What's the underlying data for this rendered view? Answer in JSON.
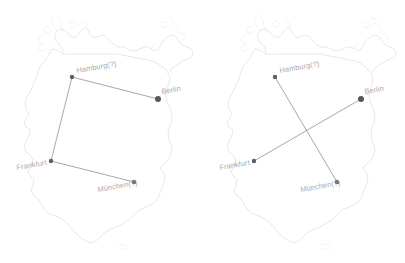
{
  "figure": {
    "background_color": "#ffffff",
    "outline_color": "#d8d8da",
    "label_color": "#a9a9ad",
    "marker_color": "#5d5d63",
    "edge_color": "#8b8b90",
    "label_rotation_deg": -10
  },
  "chart_data": {
    "type": "map",
    "title": "",
    "subtitle": "",
    "xlabel": "",
    "ylabel": "",
    "grid": false,
    "legend": "none",
    "region": "Germany",
    "panel_count": 2,
    "nodes": [
      {
        "id": "hamburg",
        "label": "Hamburg(?)",
        "x": 72,
        "y": 77,
        "marker_size": 2.2,
        "label_dx": 5,
        "label_dy": -4
      },
      {
        "id": "berlin",
        "label": "Berlin",
        "x": 158,
        "y": 99,
        "marker_size": 3.0,
        "label_dx": 4,
        "label_dy": -5
      },
      {
        "id": "frankfurt",
        "label": "Frankfurt",
        "x": 51,
        "y": 161,
        "marker_size": 2.2,
        "label_dx": -34,
        "label_dy": 9
      },
      {
        "id": "muenchen",
        "label": "München(?)",
        "x": 134,
        "y": 182,
        "marker_size": 2.2,
        "label_dx": -36,
        "label_dy": 10
      }
    ],
    "panels": [
      {
        "index": 0,
        "name": "left-tour",
        "edges": [
          {
            "from": "hamburg",
            "to": "berlin"
          },
          {
            "from": "hamburg",
            "to": "frankfurt"
          },
          {
            "from": "frankfurt",
            "to": "muenchen"
          }
        ]
      },
      {
        "index": 1,
        "name": "right-tour",
        "edges": [
          {
            "from": "hamburg",
            "to": "muenchen"
          },
          {
            "from": "frankfurt",
            "to": "berlin"
          }
        ]
      }
    ]
  },
  "labels": {
    "hamburg": "Hamburg(?)",
    "berlin": "Berlin",
    "frankfurt": "Frankfurt",
    "muenchen": "München(?)"
  }
}
